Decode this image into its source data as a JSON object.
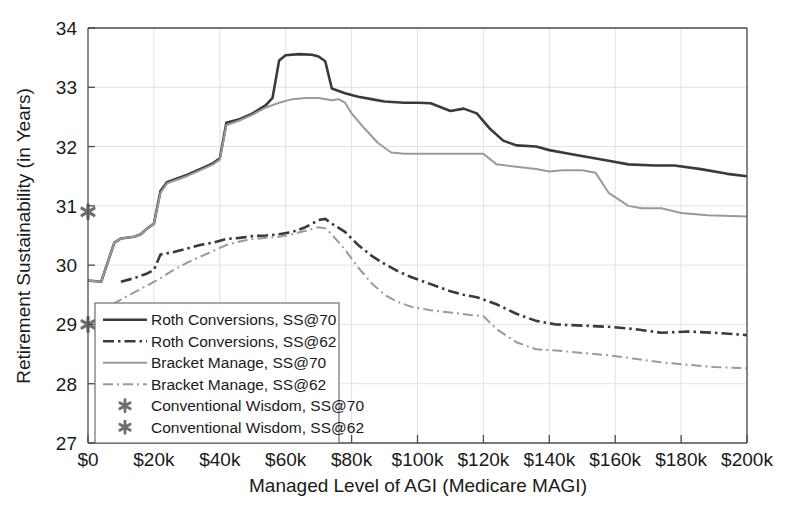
{
  "chart_data": {
    "type": "line",
    "title": "",
    "xlabel": "Managed Level of AGI (Medicare MAGI)",
    "ylabel": "Retirement Sustainability (in Years)",
    "xlim": [
      0,
      200000
    ],
    "ylim": [
      27,
      34
    ],
    "xticks": [
      0,
      20000,
      40000,
      60000,
      80000,
      100000,
      120000,
      140000,
      160000,
      180000,
      200000
    ],
    "xtick_labels": [
      "$0",
      "$20k",
      "$40k",
      "$60k",
      "$80k",
      "$100k",
      "$120k",
      "$140k",
      "$160k",
      "$180k",
      "$200k"
    ],
    "yticks": [
      27,
      28,
      29,
      30,
      31,
      32,
      33,
      34
    ],
    "ytick_labels": [
      "27",
      "28",
      "29",
      "30",
      "31",
      "32",
      "33",
      "34"
    ],
    "grid": true,
    "legend_position": "lower-left",
    "series": [
      {
        "name": "Roth Conversions, SS@70",
        "style": "solid",
        "color": "#3a3a3a",
        "width": 2.6,
        "points": [
          [
            0,
            29.74
          ],
          [
            4000,
            29.72
          ],
          [
            8000,
            30.38
          ],
          [
            10000,
            30.45
          ],
          [
            14000,
            30.48
          ],
          [
            16000,
            30.52
          ],
          [
            18000,
            30.62
          ],
          [
            20000,
            30.7
          ],
          [
            22000,
            31.25
          ],
          [
            24000,
            31.4
          ],
          [
            26000,
            31.44
          ],
          [
            30000,
            31.52
          ],
          [
            34000,
            31.62
          ],
          [
            38000,
            31.72
          ],
          [
            40000,
            31.8
          ],
          [
            42000,
            32.4
          ],
          [
            46000,
            32.46
          ],
          [
            50000,
            32.56
          ],
          [
            54000,
            32.7
          ],
          [
            56000,
            32.82
          ],
          [
            58000,
            33.45
          ],
          [
            60000,
            33.54
          ],
          [
            64000,
            33.56
          ],
          [
            68000,
            33.55
          ],
          [
            70000,
            33.52
          ],
          [
            72000,
            33.44
          ],
          [
            74000,
            32.98
          ],
          [
            78000,
            32.9
          ],
          [
            82000,
            32.84
          ],
          [
            86000,
            32.8
          ],
          [
            90000,
            32.76
          ],
          [
            96000,
            32.74
          ],
          [
            100000,
            32.74
          ],
          [
            104000,
            32.73
          ],
          [
            110000,
            32.6
          ],
          [
            114000,
            32.64
          ],
          [
            118000,
            32.56
          ],
          [
            122000,
            32.3
          ],
          [
            126000,
            32.1
          ],
          [
            130000,
            32.02
          ],
          [
            136000,
            32.0
          ],
          [
            140000,
            31.94
          ],
          [
            146000,
            31.88
          ],
          [
            152000,
            31.82
          ],
          [
            158000,
            31.76
          ],
          [
            164000,
            31.7
          ],
          [
            172000,
            31.68
          ],
          [
            178000,
            31.68
          ],
          [
            186000,
            31.62
          ],
          [
            194000,
            31.54
          ],
          [
            200000,
            31.5
          ]
        ]
      },
      {
        "name": "Roth Conversions, SS@62",
        "style": "dashdot-dark",
        "color": "#3a3a3a",
        "width": 2.6,
        "points": [
          [
            10000,
            29.72
          ],
          [
            14000,
            29.78
          ],
          [
            18000,
            29.86
          ],
          [
            20000,
            29.92
          ],
          [
            22000,
            30.18
          ],
          [
            26000,
            30.22
          ],
          [
            30000,
            30.28
          ],
          [
            34000,
            30.34
          ],
          [
            38000,
            30.38
          ],
          [
            42000,
            30.44
          ],
          [
            46000,
            30.46
          ],
          [
            50000,
            30.49
          ],
          [
            54000,
            30.5
          ],
          [
            58000,
            30.52
          ],
          [
            62000,
            30.56
          ],
          [
            66000,
            30.64
          ],
          [
            70000,
            30.76
          ],
          [
            72000,
            30.78
          ],
          [
            74000,
            30.7
          ],
          [
            78000,
            30.56
          ],
          [
            82000,
            30.34
          ],
          [
            86000,
            30.16
          ],
          [
            90000,
            30.02
          ],
          [
            94000,
            29.9
          ],
          [
            98000,
            29.8
          ],
          [
            102000,
            29.72
          ],
          [
            106000,
            29.64
          ],
          [
            110000,
            29.56
          ],
          [
            114000,
            29.5
          ],
          [
            118000,
            29.46
          ],
          [
            124000,
            29.34
          ],
          [
            130000,
            29.18
          ],
          [
            136000,
            29.06
          ],
          [
            142000,
            29.0
          ],
          [
            150000,
            28.98
          ],
          [
            158000,
            28.96
          ],
          [
            166000,
            28.92
          ],
          [
            174000,
            28.86
          ],
          [
            182000,
            28.88
          ],
          [
            190000,
            28.86
          ],
          [
            200000,
            28.82
          ]
        ]
      },
      {
        "name": "Bracket Manage, SS@70",
        "style": "solid",
        "color": "#9a9a9a",
        "width": 2.0,
        "points": [
          [
            0,
            29.74
          ],
          [
            4000,
            29.72
          ],
          [
            8000,
            30.38
          ],
          [
            10000,
            30.45
          ],
          [
            14000,
            30.48
          ],
          [
            16000,
            30.52
          ],
          [
            18000,
            30.62
          ],
          [
            20000,
            30.7
          ],
          [
            22000,
            31.22
          ],
          [
            24000,
            31.38
          ],
          [
            26000,
            31.42
          ],
          [
            30000,
            31.5
          ],
          [
            34000,
            31.6
          ],
          [
            38000,
            31.7
          ],
          [
            40000,
            31.78
          ],
          [
            42000,
            32.36
          ],
          [
            46000,
            32.44
          ],
          [
            50000,
            32.54
          ],
          [
            54000,
            32.66
          ],
          [
            58000,
            32.74
          ],
          [
            62000,
            32.8
          ],
          [
            66000,
            32.82
          ],
          [
            70000,
            32.82
          ],
          [
            74000,
            32.78
          ],
          [
            76000,
            32.8
          ],
          [
            78000,
            32.74
          ],
          [
            80000,
            32.56
          ],
          [
            84000,
            32.3
          ],
          [
            88000,
            32.06
          ],
          [
            92000,
            31.9
          ],
          [
            96000,
            31.88
          ],
          [
            102000,
            31.88
          ],
          [
            108000,
            31.88
          ],
          [
            114000,
            31.88
          ],
          [
            120000,
            31.88
          ],
          [
            124000,
            31.7
          ],
          [
            130000,
            31.66
          ],
          [
            136000,
            31.62
          ],
          [
            140000,
            31.58
          ],
          [
            144000,
            31.6
          ],
          [
            150000,
            31.6
          ],
          [
            154000,
            31.56
          ],
          [
            158000,
            31.22
          ],
          [
            164000,
            31.0
          ],
          [
            168000,
            30.96
          ],
          [
            174000,
            30.96
          ],
          [
            180000,
            30.88
          ],
          [
            188000,
            30.84
          ],
          [
            200000,
            30.82
          ]
        ]
      },
      {
        "name": "Bracket Manage, SS@62",
        "style": "dashdot-light",
        "color": "#9a9a9a",
        "width": 2.0,
        "points": [
          [
            2000,
            29.2
          ],
          [
            6000,
            29.3
          ],
          [
            10000,
            29.42
          ],
          [
            14000,
            29.54
          ],
          [
            18000,
            29.66
          ],
          [
            22000,
            29.78
          ],
          [
            26000,
            29.92
          ],
          [
            30000,
            30.04
          ],
          [
            34000,
            30.14
          ],
          [
            38000,
            30.24
          ],
          [
            42000,
            30.34
          ],
          [
            46000,
            30.4
          ],
          [
            50000,
            30.44
          ],
          [
            54000,
            30.46
          ],
          [
            58000,
            30.48
          ],
          [
            62000,
            30.52
          ],
          [
            66000,
            30.58
          ],
          [
            70000,
            30.64
          ],
          [
            72000,
            30.62
          ],
          [
            74000,
            30.52
          ],
          [
            78000,
            30.26
          ],
          [
            82000,
            29.96
          ],
          [
            86000,
            29.7
          ],
          [
            90000,
            29.5
          ],
          [
            94000,
            29.38
          ],
          [
            98000,
            29.3
          ],
          [
            104000,
            29.24
          ],
          [
            110000,
            29.2
          ],
          [
            116000,
            29.16
          ],
          [
            120000,
            29.14
          ],
          [
            124000,
            28.92
          ],
          [
            130000,
            28.7
          ],
          [
            136000,
            28.58
          ],
          [
            142000,
            28.56
          ],
          [
            150000,
            28.52
          ],
          [
            158000,
            28.48
          ],
          [
            166000,
            28.42
          ],
          [
            174000,
            28.36
          ],
          [
            182000,
            28.32
          ],
          [
            190000,
            28.28
          ],
          [
            200000,
            28.26
          ]
        ]
      }
    ],
    "markers": [
      {
        "name": "Conventional Wisdom, SS@70",
        "x": 0,
        "y": 30.9,
        "symbol": "*",
        "color": "#6e6e6e"
      },
      {
        "name": "Conventional Wisdom, SS@62",
        "x": 0,
        "y": 29.0,
        "symbol": "*",
        "color": "#6e6e6e"
      }
    ]
  },
  "legend": {
    "items": [
      {
        "label": "Roth Conversions, SS@70",
        "kind": "line",
        "style": "solid",
        "color": "#3a3a3a",
        "width": 2.6
      },
      {
        "label": "Roth Conversions, SS@62",
        "kind": "line",
        "style": "dashdot-dark",
        "color": "#3a3a3a",
        "width": 2.6
      },
      {
        "label": "Bracket Manage, SS@70",
        "kind": "line",
        "style": "solid",
        "color": "#9a9a9a",
        "width": 2.0
      },
      {
        "label": "Bracket Manage, SS@62",
        "kind": "line",
        "style": "dashdot-light",
        "color": "#9a9a9a",
        "width": 2.0
      },
      {
        "label": "Conventional Wisdom, SS@70",
        "kind": "marker",
        "symbol": "*",
        "color": "#6e6e6e"
      },
      {
        "label": "Conventional Wisdom, SS@62",
        "kind": "marker",
        "symbol": "*",
        "color": "#6e6e6e"
      }
    ]
  },
  "colors": {
    "axis": "#4d4d4d",
    "grid": "#e2e2e2",
    "text": "#1a1a1a",
    "background": "#ffffff",
    "dark_series": "#3a3a3a",
    "light_series": "#9a9a9a",
    "marker": "#6e6e6e"
  }
}
